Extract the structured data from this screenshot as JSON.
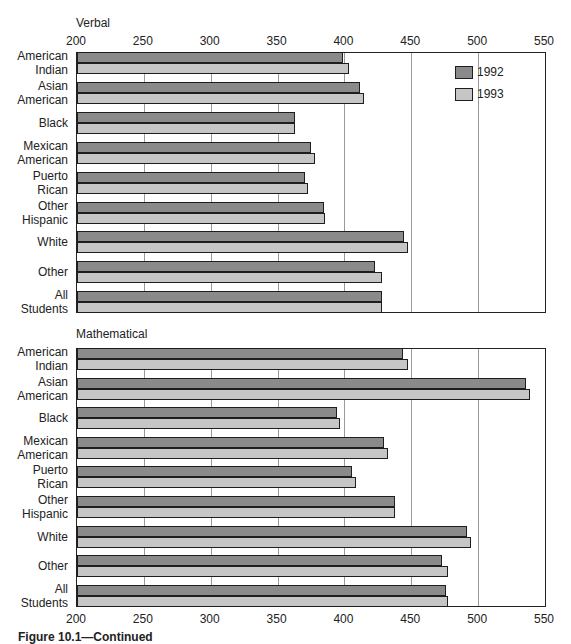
{
  "chart_data": [
    {
      "type": "bar",
      "orientation": "horizontal",
      "title": "Verbal",
      "categories": [
        "American Indian",
        "Asian American",
        "Black",
        "Mexican American",
        "Puerto Rican",
        "Other Hispanic",
        "White",
        "Other",
        "All Students"
      ],
      "category_label_lines": [
        [
          "American",
          "Indian"
        ],
        [
          "Asian",
          "American"
        ],
        [
          "Black"
        ],
        [
          "Mexican",
          "American"
        ],
        [
          "Puerto",
          "Rican"
        ],
        [
          "Other",
          "Hispanic"
        ],
        [
          "White"
        ],
        [
          "Other"
        ],
        [
          "All",
          "Students"
        ]
      ],
      "series": [
        {
          "name": "1992",
          "color": "#8a8a8a",
          "values": [
            398,
            411,
            362,
            374,
            370,
            384,
            444,
            422,
            427
          ]
        },
        {
          "name": "1993",
          "color": "#c6c6c6",
          "values": [
            403,
            414,
            362,
            377,
            372,
            385,
            447,
            427,
            427
          ]
        }
      ],
      "xlim": [
        200,
        550
      ],
      "xticks": [
        200,
        250,
        300,
        350,
        400,
        450,
        500,
        550
      ],
      "xtick_position": "top",
      "gridlines": [
        250,
        300,
        350,
        400,
        450,
        500
      ],
      "legend": {
        "position": "upper right inside",
        "entries": [
          "1992",
          "1993"
        ]
      },
      "xlabel": "",
      "ylabel": ""
    },
    {
      "type": "bar",
      "orientation": "horizontal",
      "title": "Mathematical",
      "categories": [
        "American Indian",
        "Asian American",
        "Black",
        "Mexican American",
        "Puerto Rican",
        "Other Hispanic",
        "White",
        "Other",
        "All Students"
      ],
      "category_label_lines": [
        [
          "American",
          "Indian"
        ],
        [
          "Asian",
          "American"
        ],
        [
          "Black"
        ],
        [
          "Mexican",
          "American"
        ],
        [
          "Puerto",
          "Rican"
        ],
        [
          "Other",
          "Hispanic"
        ],
        [
          "White"
        ],
        [
          "Other"
        ],
        [
          "All",
          "Students"
        ]
      ],
      "series": [
        {
          "name": "1992",
          "color": "#8a8a8a",
          "values": [
            443,
            535,
            394,
            429,
            405,
            437,
            491,
            472,
            475
          ]
        },
        {
          "name": "1993",
          "color": "#c6c6c6",
          "values": [
            447,
            538,
            396,
            432,
            408,
            437,
            494,
            477,
            477
          ]
        }
      ],
      "xlim": [
        200,
        550
      ],
      "xticks": [
        200,
        250,
        300,
        350,
        400,
        450,
        500,
        550
      ],
      "xtick_position": "bottom",
      "gridlines": [
        250,
        300,
        350,
        400,
        450,
        500
      ],
      "xlabel": "",
      "ylabel": ""
    }
  ],
  "labels": {
    "verbal_title": "Verbal",
    "math_title": "Mathematical",
    "legend_1992": "1992",
    "legend_1993": "1993",
    "caption": "Figure 10.1—Continued"
  }
}
